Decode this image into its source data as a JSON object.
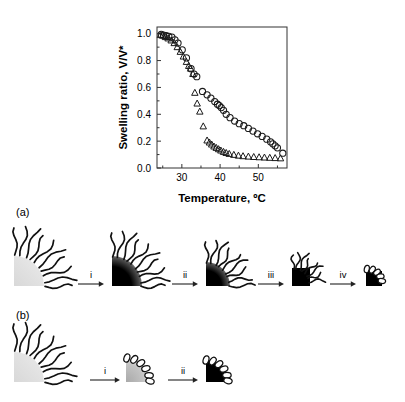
{
  "figure": {
    "panels": [
      {
        "id": "chart",
        "label": ""
      },
      {
        "id": "schematic-a",
        "label": "(a)"
      },
      {
        "id": "schematic-b",
        "label": "(b)"
      }
    ]
  },
  "chart_data": {
    "type": "scatter",
    "title": "",
    "xlabel": "Temperature, ºC",
    "ylabel": "Swelling ratio, V/V*",
    "xlim": [
      23.5,
      57.5
    ],
    "ylim": [
      0.0,
      1.05
    ],
    "xticks": [
      30,
      40,
      50
    ],
    "xtick_labels": [
      "30",
      "40",
      "50"
    ],
    "yticks": [
      0.0,
      0.2,
      0.4,
      0.6,
      0.8,
      1.0
    ],
    "ytick_labels": [
      "0.0",
      "0.2",
      "0.4",
      "0.6",
      "0.8",
      "1.0"
    ],
    "grid": false,
    "legend": "none",
    "series": [
      {
        "name": "circles",
        "marker": "circle",
        "color": "#1a1a1a",
        "points": [
          [
            24.6,
            0.995
          ],
          [
            25.2,
            0.99
          ],
          [
            25.9,
            0.985
          ],
          [
            26.6,
            0.98
          ],
          [
            27.4,
            0.975
          ],
          [
            28.2,
            0.955
          ],
          [
            29.0,
            0.93
          ],
          [
            30.1,
            0.88
          ],
          [
            31.2,
            0.82
          ],
          [
            32.4,
            0.74
          ],
          [
            33.2,
            0.7
          ],
          [
            33.9,
            0.68
          ],
          [
            35.4,
            0.57
          ],
          [
            36.6,
            0.545
          ],
          [
            37.6,
            0.52
          ],
          [
            38.6,
            0.495
          ],
          [
            39.3,
            0.475
          ],
          [
            39.8,
            0.465
          ],
          [
            40.3,
            0.45
          ],
          [
            40.9,
            0.43
          ],
          [
            41.6,
            0.4
          ],
          [
            42.6,
            0.375
          ],
          [
            43.8,
            0.35
          ],
          [
            45.0,
            0.33
          ],
          [
            46.2,
            0.315
          ],
          [
            47.4,
            0.295
          ],
          [
            48.6,
            0.275
          ],
          [
            49.8,
            0.255
          ],
          [
            51.0,
            0.235
          ],
          [
            52.2,
            0.215
          ],
          [
            53.2,
            0.195
          ],
          [
            53.8,
            0.18
          ],
          [
            54.4,
            0.165
          ],
          [
            55.0,
            0.15
          ],
          [
            56.4,
            0.11
          ]
        ]
      },
      {
        "name": "triangles",
        "marker": "triangle",
        "color": "#1a1a1a",
        "points": [
          [
            24.4,
            0.99
          ],
          [
            25.0,
            0.985
          ],
          [
            25.7,
            0.975
          ],
          [
            26.4,
            0.965
          ],
          [
            27.2,
            0.95
          ],
          [
            28.0,
            0.93
          ],
          [
            28.8,
            0.9
          ],
          [
            29.6,
            0.865
          ],
          [
            30.4,
            0.83
          ],
          [
            31.2,
            0.79
          ],
          [
            31.8,
            0.76
          ],
          [
            32.3,
            0.74
          ],
          [
            32.9,
            0.7
          ],
          [
            33.4,
            0.56
          ],
          [
            34.0,
            0.48
          ],
          [
            34.7,
            0.42
          ],
          [
            35.6,
            0.31
          ],
          [
            36.6,
            0.205
          ],
          [
            37.2,
            0.19
          ],
          [
            37.8,
            0.175
          ],
          [
            38.4,
            0.16
          ],
          [
            39.0,
            0.15
          ],
          [
            39.6,
            0.14
          ],
          [
            40.2,
            0.13
          ],
          [
            40.9,
            0.12
          ],
          [
            41.6,
            0.112
          ],
          [
            42.4,
            0.105
          ],
          [
            43.6,
            0.098
          ],
          [
            44.8,
            0.092
          ],
          [
            46.0,
            0.088
          ],
          [
            47.4,
            0.085
          ],
          [
            48.8,
            0.082
          ],
          [
            50.2,
            0.08
          ],
          [
            51.6,
            0.078
          ],
          [
            53.0,
            0.076
          ],
          [
            54.4,
            0.074
          ],
          [
            55.8,
            0.072
          ]
        ]
      }
    ]
  },
  "schematic_a": {
    "label": "(a)",
    "steps": [
      "i",
      "ii",
      "iii",
      "iv"
    ],
    "states": [
      {
        "name": "swollen-particle",
        "core_shade": "light",
        "chains": "extended"
      },
      {
        "name": "collapsing-core-particle",
        "core_shade": "gradient-dark",
        "chains": "extended"
      },
      {
        "name": "shrinking-particle",
        "core_shade": "gradient-dark",
        "chains": "extended"
      },
      {
        "name": "collapsed-core-particle",
        "core_shade": "black",
        "chains": "partially-collapsed"
      },
      {
        "name": "fully-collapsed-particle",
        "core_shade": "black",
        "chains": "collapsed"
      }
    ]
  },
  "schematic_b": {
    "label": "(b)",
    "steps": [
      "i",
      "ii"
    ],
    "states": [
      {
        "name": "swollen-particle",
        "core_shade": "light",
        "chains": "extended"
      },
      {
        "name": "chain-collapsed-particle",
        "core_shade": "light-gradient",
        "chains": "collapsed"
      },
      {
        "name": "fully-collapsed-particle",
        "core_shade": "black",
        "chains": "collapsed"
      }
    ]
  }
}
